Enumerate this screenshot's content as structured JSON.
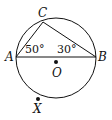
{
  "diagram": {
    "type": "circle-geometry",
    "points": {
      "A": {
        "label": "A"
      },
      "B": {
        "label": "B"
      },
      "C": {
        "label": "C"
      },
      "O": {
        "label": "O"
      },
      "X": {
        "label": "X"
      }
    },
    "angles": {
      "CAB": {
        "label": "50°"
      },
      "CBA": {
        "label": "30°"
      }
    },
    "segments": [
      "AB",
      "AC",
      "CB"
    ],
    "colors": {
      "stroke": "#111111",
      "background": "#ffffff"
    }
  }
}
